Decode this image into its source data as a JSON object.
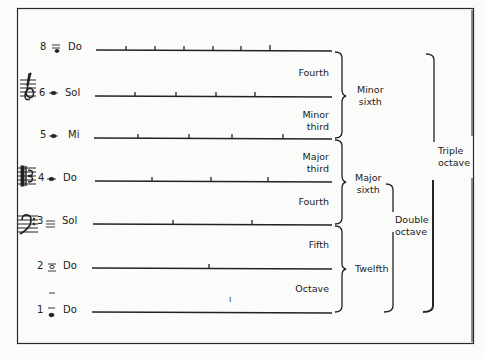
{
  "diagram": {
    "type": "harmonic-series-intervals",
    "harmonics": [
      {
        "number": "8",
        "note": "Do",
        "clef": "treble",
        "y": 50,
        "ticks": [
          126,
          155,
          184,
          213,
          241,
          270
        ]
      },
      {
        "number": "6",
        "note": "Sol",
        "clef": "treble",
        "y": 96,
        "ticks": [
          135,
          176,
          216,
          255
        ]
      },
      {
        "number": "5",
        "note": "Mi",
        "clef": "",
        "y": 138,
        "ticks": [
          138,
          189,
          232,
          283
        ]
      },
      {
        "number": "4",
        "note": "Do",
        "clef": "alto",
        "y": 181,
        "ticks": [
          152,
          211,
          268
        ]
      },
      {
        "number": "3",
        "note": "Sol",
        "clef": "bass",
        "y": 224,
        "ticks": [
          173,
          252
        ]
      },
      {
        "number": "2",
        "note": "Do",
        "clef": "",
        "y": 268,
        "ticks": [
          209
        ]
      },
      {
        "number": "1",
        "note": "Do",
        "clef": "",
        "y": 312,
        "ticks": []
      }
    ],
    "intervals": [
      {
        "label_line1": "Fourth",
        "label_line2": "",
        "top": 50,
        "bottom": 96
      },
      {
        "label_line1": "Minor",
        "label_line2": "third",
        "top": 96,
        "bottom": 138
      },
      {
        "label_line1": "Major",
        "label_line2": "third",
        "top": 138,
        "bottom": 181
      },
      {
        "label_line1": "Fourth",
        "label_line2": "",
        "top": 181,
        "bottom": 224
      },
      {
        "label_line1": "Fifth",
        "label_line2": "",
        "top": 224,
        "bottom": 268
      },
      {
        "label_line1": "Octave",
        "label_line2": "",
        "top": 268,
        "bottom": 312
      }
    ],
    "spans": [
      {
        "label_line1": "Minor",
        "label_line2": "sixth",
        "from": "8 Do",
        "to": "5 Mi"
      },
      {
        "label_line1": "Major",
        "label_line2": "sixth",
        "from": "5 Mi",
        "to": "3 Sol"
      },
      {
        "label_line1": "Twelfth",
        "label_line2": "",
        "from": "3 Sol",
        "to": "1 Do"
      },
      {
        "label_line1": "Double",
        "label_line2": "octave",
        "from": "4 Do",
        "to": "1 Do"
      },
      {
        "label_line1": "Triple",
        "label_line2": "octave",
        "from": "8 Do",
        "to": "1 Do"
      }
    ],
    "stray_mark": "ı"
  }
}
